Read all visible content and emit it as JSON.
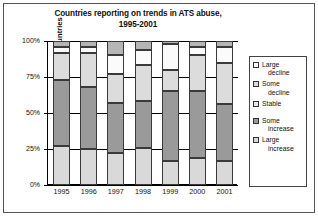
{
  "chart_data": {
    "type": "bar",
    "stacked": true,
    "stack_mode": "percent",
    "title": "Countries reporting on trends in ATS abuse, 1995-2001",
    "title_line1": "Countries reporting on trends in ATS abuse,",
    "title_line2": "1995-2001",
    "xlabel": "",
    "ylabel": "Proportion of countries",
    "ylim": [
      0,
      100
    ],
    "yticks": [
      "0%",
      "25%",
      "50%",
      "75%",
      "100%"
    ],
    "ytick_values": [
      0,
      25,
      50,
      75,
      100
    ],
    "grid": true,
    "legend_position": "right",
    "categories": [
      "1995",
      "1996",
      "1997",
      "1998",
      "1999",
      "2000",
      "2001"
    ],
    "series": [
      {
        "name": "Large increase",
        "color": "#d9d9d9",
        "values": [
          27,
          25,
          22,
          26,
          17,
          19,
          17
        ]
      },
      {
        "name": "Some increase",
        "color": "#9a9a9a",
        "values": [
          46,
          43,
          35,
          32,
          48,
          46,
          39
        ]
      },
      {
        "name": "Stable",
        "color": "#dcdcdc",
        "values": [
          19,
          24,
          20,
          25,
          15,
          25,
          29
        ]
      },
      {
        "name": "Some decline",
        "color": "#fbfbfb",
        "values": [
          4,
          4,
          13,
          11,
          18,
          6,
          11
        ]
      },
      {
        "name": "Large decline",
        "color": "#b5b5b5",
        "values": [
          4,
          4,
          10,
          6,
          2,
          4,
          4
        ]
      }
    ],
    "legend": [
      {
        "label_line1": "Large",
        "label_line2": "decline",
        "color": "#fbfbfb"
      },
      {
        "label_line1": "Some",
        "label_line2": "decline",
        "color": "#dcdcdc"
      },
      {
        "label_line1": "Stable",
        "label_line2": "",
        "color": "#eaeaea"
      },
      {
        "label_line1": "Some",
        "label_line2": "increase",
        "color": "#9a9a9a"
      },
      {
        "label_line1": "Large",
        "label_line2": "increase",
        "color": "#d9d9d9"
      }
    ]
  }
}
